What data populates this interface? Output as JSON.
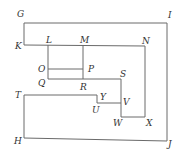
{
  "diagram": {
    "labels": [
      {
        "id": "G",
        "text": "G",
        "x": 17,
        "y": 17
      },
      {
        "id": "I",
        "text": "I",
        "x": 168,
        "y": 18
      },
      {
        "id": "K",
        "text": "K",
        "x": 15,
        "y": 49
      },
      {
        "id": "L",
        "text": "L",
        "x": 46,
        "y": 43
      },
      {
        "id": "M",
        "text": "M",
        "x": 80,
        "y": 43
      },
      {
        "id": "N",
        "text": "N",
        "x": 142,
        "y": 44
      },
      {
        "id": "O",
        "text": "O",
        "x": 38,
        "y": 72
      },
      {
        "id": "P",
        "text": "P",
        "x": 88,
        "y": 72
      },
      {
        "id": "Q",
        "text": "Q",
        "x": 38,
        "y": 86
      },
      {
        "id": "R",
        "text": "R",
        "x": 80,
        "y": 90
      },
      {
        "id": "S",
        "text": "S",
        "x": 120,
        "y": 77
      },
      {
        "id": "T",
        "text": "T",
        "x": 15,
        "y": 98
      },
      {
        "id": "Y",
        "text": "Y",
        "x": 100,
        "y": 100
      },
      {
        "id": "U",
        "text": "U",
        "x": 92,
        "y": 113
      },
      {
        "id": "V",
        "text": "V",
        "x": 123,
        "y": 105
      },
      {
        "id": "W",
        "text": "W",
        "x": 113,
        "y": 126
      },
      {
        "id": "X",
        "text": "X",
        "x": 146,
        "y": 126
      },
      {
        "id": "H",
        "text": "H",
        "x": 14,
        "y": 144
      },
      {
        "id": "J",
        "text": "J",
        "x": 168,
        "y": 147
      }
    ]
  }
}
